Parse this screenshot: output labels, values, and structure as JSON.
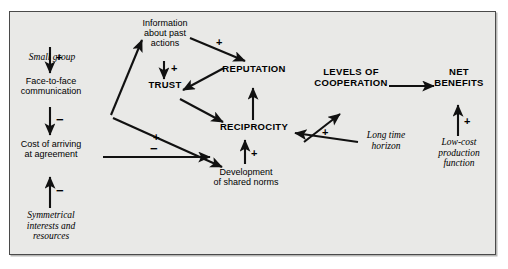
{
  "figure": {
    "caption_clipped": "",
    "panel_background": "#e9e9e7",
    "panel_border": "#4a4a4a"
  },
  "diagram": {
    "type": "causal-loop-diagram",
    "nodes": [
      {
        "id": "small-group",
        "label": "Small group",
        "style": "italic"
      },
      {
        "id": "face-to-face",
        "label": "Face-to-face\ncommunication",
        "style": "plain"
      },
      {
        "id": "cost-of-arriving",
        "label": "Cost of arriving\nat agreement",
        "style": "plain"
      },
      {
        "id": "symmetrical",
        "label": "Symmetrical\ninterests and\nresources",
        "style": "italic"
      },
      {
        "id": "information",
        "label": "Information\nabout past\nactions",
        "style": "plain"
      },
      {
        "id": "trust",
        "label": "TRUST",
        "style": "bold"
      },
      {
        "id": "reputation",
        "label": "REPUTATION",
        "style": "bold"
      },
      {
        "id": "reciprocity",
        "label": "RECIPROCITY",
        "style": "bold"
      },
      {
        "id": "shared-norms",
        "label": "Development\nof shared norms",
        "style": "plain"
      },
      {
        "id": "levels-cooperation",
        "label": "LEVELS OF\nCOOPERATION",
        "style": "bold"
      },
      {
        "id": "net-benefits",
        "label": "NET\nBENEFITS",
        "style": "bold"
      },
      {
        "id": "long-time-horizon",
        "label": "Long time\nhorizon",
        "style": "italic"
      },
      {
        "id": "low-cost",
        "label": "Low-cost\nproduction\nfunction",
        "style": "italic"
      }
    ],
    "edges": [
      {
        "from": "small-group",
        "to": "face-to-face",
        "sign": "+"
      },
      {
        "from": "face-to-face",
        "to": "cost-of-arriving",
        "sign": "−"
      },
      {
        "from": "symmetrical",
        "to": "cost-of-arriving",
        "sign": "−"
      },
      {
        "from": "face-to-face",
        "to": "information",
        "sign": ""
      },
      {
        "from": "face-to-face",
        "to": "shared-norms",
        "sign": "+"
      },
      {
        "from": "cost-of-arriving",
        "to": "shared-norms",
        "sign": "−"
      },
      {
        "from": "information",
        "to": "trust",
        "sign": "+"
      },
      {
        "from": "information",
        "to": "reputation",
        "sign": "+"
      },
      {
        "from": "reputation",
        "to": "trust",
        "sign": ""
      },
      {
        "from": "trust",
        "to": "reciprocity",
        "sign": ""
      },
      {
        "from": "reciprocity",
        "to": "reputation",
        "sign": ""
      },
      {
        "from": "shared-norms",
        "to": "reciprocity",
        "sign": "+"
      },
      {
        "from": "reciprocity",
        "to": "levels-cooperation",
        "sign": ""
      },
      {
        "from": "long-time-horizon",
        "to": "reciprocity",
        "sign": "+"
      },
      {
        "from": "levels-cooperation",
        "to": "net-benefits",
        "sign": ""
      },
      {
        "from": "low-cost",
        "to": "net-benefits",
        "sign": "+"
      }
    ],
    "signs": {
      "small_group_to_face": "+",
      "face_to_cost": "−",
      "symmetrical_to_cost": "−",
      "face_to_norms": "+",
      "cost_to_norms": "−",
      "information_to_trust": "+",
      "information_to_reputation": "+",
      "norms_to_reciprocity": "+",
      "horizon_to_reciprocity": "+",
      "lowcost_to_benefits": "+"
    }
  }
}
